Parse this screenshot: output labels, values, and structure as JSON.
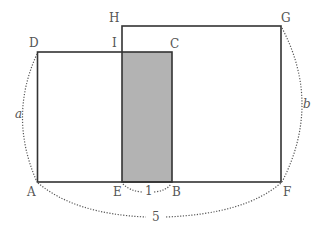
{
  "diagram": {
    "type": "geometry-figure",
    "colors": {
      "stroke": "#333333",
      "shade": "#b3b3b3",
      "label": "#555555",
      "dotted": "#555555"
    },
    "points": {
      "A": {
        "label": "A"
      },
      "B": {
        "label": "B"
      },
      "C": {
        "label": "C"
      },
      "D": {
        "label": "D"
      },
      "E": {
        "label": "E"
      },
      "F": {
        "label": "F"
      },
      "G": {
        "label": "G"
      },
      "H": {
        "label": "H"
      },
      "I": {
        "label": "I"
      }
    },
    "measures": {
      "AD": {
        "label": "a"
      },
      "FG": {
        "label": "b"
      },
      "EB": {
        "label": "1"
      },
      "AF": {
        "label": "5"
      }
    },
    "rectangles": [
      {
        "name": "ABCD",
        "vertices": [
          "A",
          "B",
          "C",
          "D"
        ]
      },
      {
        "name": "EFGH",
        "vertices": [
          "E",
          "F",
          "G",
          "H"
        ]
      }
    ],
    "shaded_region": {
      "name": "IEBC",
      "vertices": [
        "I",
        "E",
        "B",
        "C"
      ]
    }
  }
}
